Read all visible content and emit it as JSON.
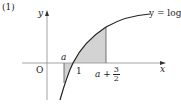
{
  "problem_label": "(1)",
  "axes": {
    "x_label": "x",
    "y_label": "y",
    "origin_label": "O"
  },
  "curve": {
    "label": "y = log x",
    "equation": "y=\\log x"
  },
  "markers": {
    "a_label": "a",
    "one_label": "1",
    "upper_label_prefix": "a +",
    "upper_frac_num": "3",
    "upper_frac_den": "2"
  },
  "colors": {
    "shade": "#d3d3d3",
    "axis": "#999999",
    "curve": "#222222",
    "text": "#222222"
  },
  "regions": [
    {
      "name": "below-axis-region",
      "from": "a",
      "to": "1",
      "shaded": true
    },
    {
      "name": "above-axis-region",
      "from": "1",
      "to": "a+3/2",
      "shaded": true
    }
  ]
}
